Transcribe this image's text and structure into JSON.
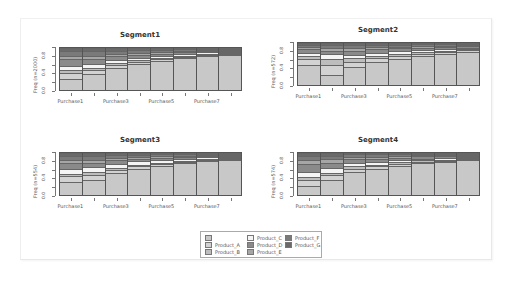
{
  "chart_data": [
    {
      "type": "bar",
      "stacked": true,
      "title": "Segment1",
      "ylabel": "Freq (n=2000)",
      "xlabel": "",
      "ylim": [
        0,
        1
      ],
      "yticks": [
        "0.0",
        "0.4",
        "0.8"
      ],
      "categories": [
        "Purchase1",
        "Purchase2",
        "Purchase3",
        "Purchase4",
        "Purchase5",
        "Purchase6",
        "Purchase7",
        "Purchase8"
      ],
      "visible_xtick_labels": [
        "Purchase1",
        "Purchase3",
        "Purchase5",
        "Purchase7"
      ],
      "series": [
        {
          "name": "",
          "values": [
            0.27,
            0.37,
            0.52,
            0.62,
            0.7,
            0.76,
            0.82,
            0.88
          ]
        },
        {
          "name": "Product_A",
          "values": [
            0.14,
            0.1,
            0.07,
            0.05,
            0.04,
            0.03,
            0.03,
            0.02
          ]
        },
        {
          "name": "Product_B",
          "values": [
            0.06,
            0.06,
            0.05,
            0.04,
            0.03,
            0.03,
            0.02,
            0.02
          ]
        },
        {
          "name": "Product_C",
          "values": [
            0.1,
            0.1,
            0.08,
            0.06,
            0.05,
            0.04,
            0.03,
            0.02
          ]
        },
        {
          "name": "Product_D",
          "values": [
            0.16,
            0.1,
            0.08,
            0.06,
            0.05,
            0.04,
            0.03,
            0.02
          ]
        },
        {
          "name": "Product_E",
          "values": [
            0.08,
            0.08,
            0.06,
            0.05,
            0.04,
            0.03,
            0.02,
            0.01
          ]
        },
        {
          "name": "Product_F",
          "values": [
            0.11,
            0.11,
            0.08,
            0.07,
            0.05,
            0.04,
            0.03,
            0.02
          ]
        },
        {
          "name": "Product_G",
          "values": [
            0.08,
            0.08,
            0.06,
            0.05,
            0.04,
            0.03,
            0.02,
            0.01
          ]
        }
      ]
    },
    {
      "type": "bar",
      "stacked": true,
      "title": "Segment2",
      "ylabel": "Freq (n=572)",
      "xlabel": "",
      "ylim": [
        0,
        1
      ],
      "yticks": [
        "0.0",
        "0.4",
        "0.8"
      ],
      "categories": [
        "Purchase1",
        "Purchase2",
        "Purchase3",
        "Purchase4",
        "Purchase5",
        "Purchase6",
        "Purchase7",
        "Purchase8"
      ],
      "visible_xtick_labels": [
        "Purchase1",
        "Purchase3",
        "Purchase5",
        "Purchase7"
      ],
      "series": [
        {
          "name": "",
          "values": [
            0.48,
            0.25,
            0.42,
            0.54,
            0.62,
            0.68,
            0.74,
            0.8
          ]
        },
        {
          "name": "Product_A",
          "values": [
            0.14,
            0.22,
            0.14,
            0.1,
            0.07,
            0.06,
            0.05,
            0.04
          ]
        },
        {
          "name": "Product_B",
          "values": [
            0.06,
            0.15,
            0.08,
            0.06,
            0.05,
            0.04,
            0.03,
            0.02
          ]
        },
        {
          "name": "Product_C",
          "values": [
            0.08,
            0.12,
            0.08,
            0.07,
            0.06,
            0.05,
            0.04,
            0.03
          ]
        },
        {
          "name": "Product_D",
          "values": [
            0.1,
            0.08,
            0.1,
            0.08,
            0.07,
            0.06,
            0.05,
            0.04
          ]
        },
        {
          "name": "Product_E",
          "values": [
            0.05,
            0.06,
            0.06,
            0.05,
            0.04,
            0.04,
            0.03,
            0.02
          ]
        },
        {
          "name": "Product_F",
          "values": [
            0.05,
            0.07,
            0.07,
            0.05,
            0.05,
            0.04,
            0.03,
            0.03
          ]
        },
        {
          "name": "Product_G",
          "values": [
            0.04,
            0.05,
            0.05,
            0.05,
            0.04,
            0.03,
            0.03,
            0.02
          ]
        }
      ]
    },
    {
      "type": "bar",
      "stacked": true,
      "title": "Segment3",
      "ylabel": "Freq (n=554)",
      "xlabel": "",
      "ylim": [
        0,
        1
      ],
      "yticks": [
        "0.0",
        "0.4",
        "0.8"
      ],
      "categories": [
        "Purchase1",
        "Purchase2",
        "Purchase3",
        "Purchase4",
        "Purchase5",
        "Purchase6",
        "Purchase7",
        "Purchase8"
      ],
      "visible_xtick_labels": [
        "Purchase1",
        "Purchase3",
        "Purchase5",
        "Purchase7"
      ],
      "series": [
        {
          "name": "",
          "values": [
            0.3,
            0.36,
            0.52,
            0.63,
            0.7,
            0.76,
            0.82,
            0.86
          ]
        },
        {
          "name": "Product_A",
          "values": [
            0.15,
            0.12,
            0.08,
            0.05,
            0.04,
            0.03,
            0.03,
            0.02
          ]
        },
        {
          "name": "Product_B",
          "values": [
            0.05,
            0.06,
            0.05,
            0.04,
            0.03,
            0.03,
            0.02,
            0.02
          ]
        },
        {
          "name": "Product_C",
          "values": [
            0.11,
            0.12,
            0.1,
            0.08,
            0.06,
            0.05,
            0.04,
            0.03
          ]
        },
        {
          "name": "Product_D",
          "values": [
            0.15,
            0.1,
            0.08,
            0.06,
            0.05,
            0.04,
            0.03,
            0.02
          ]
        },
        {
          "name": "Product_E",
          "values": [
            0.08,
            0.08,
            0.06,
            0.05,
            0.04,
            0.03,
            0.02,
            0.02
          ]
        },
        {
          "name": "Product_F",
          "values": [
            0.09,
            0.09,
            0.06,
            0.05,
            0.05,
            0.04,
            0.02,
            0.02
          ]
        },
        {
          "name": "Product_G",
          "values": [
            0.07,
            0.07,
            0.05,
            0.04,
            0.03,
            0.02,
            0.02,
            0.01
          ]
        }
      ]
    },
    {
      "type": "bar",
      "stacked": true,
      "title": "Segment4",
      "ylabel": "Freq (n=574)",
      "xlabel": "",
      "ylim": [
        0,
        1
      ],
      "yticks": [
        "0.0",
        "0.4",
        "0.8"
      ],
      "categories": [
        "Purchase1",
        "Purchase2",
        "Purchase3",
        "Purchase4",
        "Purchase5",
        "Purchase6",
        "Purchase7",
        "Purchase8"
      ],
      "visible_xtick_labels": [
        "Purchase1",
        "Purchase3",
        "Purchase5",
        "Purchase7"
      ],
      "series": [
        {
          "name": "",
          "values": [
            0.22,
            0.35,
            0.55,
            0.62,
            0.7,
            0.76,
            0.8,
            0.86
          ]
        },
        {
          "name": "Product_A",
          "values": [
            0.14,
            0.12,
            0.08,
            0.06,
            0.05,
            0.04,
            0.03,
            0.02
          ]
        },
        {
          "name": "Product_B",
          "values": [
            0.06,
            0.06,
            0.05,
            0.04,
            0.03,
            0.03,
            0.02,
            0.02
          ]
        },
        {
          "name": "Product_C",
          "values": [
            0.12,
            0.12,
            0.08,
            0.07,
            0.05,
            0.04,
            0.03,
            0.03
          ]
        },
        {
          "name": "Product_D",
          "values": [
            0.2,
            0.12,
            0.09,
            0.07,
            0.06,
            0.05,
            0.05,
            0.03
          ]
        },
        {
          "name": "Product_E",
          "values": [
            0.1,
            0.08,
            0.06,
            0.05,
            0.04,
            0.03,
            0.03,
            0.02
          ]
        },
        {
          "name": "Product_F",
          "values": [
            0.09,
            0.09,
            0.06,
            0.06,
            0.04,
            0.03,
            0.02,
            0.01
          ]
        },
        {
          "name": "Product_G",
          "values": [
            0.07,
            0.06,
            0.03,
            0.03,
            0.03,
            0.02,
            0.02,
            0.01
          ]
        }
      ]
    }
  ],
  "legend": {
    "entries": [
      {
        "label": "",
        "color": "#c8c8c8"
      },
      {
        "label": "Product_A",
        "color": "#d2d2d2"
      },
      {
        "label": "Product_B",
        "color": "#bdbdbd"
      },
      {
        "label": "Product_C",
        "color": "#f4f4f4"
      },
      {
        "label": "Product_D",
        "color": "#8a8a8a"
      },
      {
        "label": "Product_E",
        "color": "#a6a6a6"
      },
      {
        "label": "Product_F",
        "color": "#7a7a7a"
      },
      {
        "label": "Product_G",
        "color": "#6a6a6a"
      }
    ]
  },
  "series_colors": [
    "#c8c8c8",
    "#d2d2d2",
    "#bdbdbd",
    "#f4f4f4",
    "#8a8a8a",
    "#a6a6a6",
    "#7a7a7a",
    "#6a6a6a"
  ]
}
